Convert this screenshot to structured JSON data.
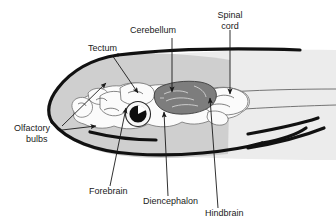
{
  "figure": {
    "background_color": "#ffffff",
    "head_fill_color": "#cfcfcf",
    "body_fill_color": "#e8e8e8",
    "cerebellum_fill_color": "#7d7d7d",
    "brain_fill_color": "#fbfbfb",
    "outline_color": "#111111",
    "label_color": "#1a1a1a"
  },
  "labels": {
    "tectum": {
      "text": "Tectum",
      "x": 88,
      "y": 51
    },
    "cerebellum": {
      "text": "Cerebellum",
      "x": 130,
      "y": 33
    },
    "spinal_cord": {
      "line1": "Spinal",
      "line2": "cord",
      "x": 224,
      "y": 18
    },
    "olfactory_bulbs": {
      "line1": "Olfactory",
      "line2": "bulbs",
      "x": 14,
      "y": 131
    },
    "forebrain": {
      "text": "Forebrain",
      "x": 89,
      "y": 194
    },
    "diencephalon": {
      "text": "Diencephalon",
      "x": 143,
      "y": 204
    },
    "hindbrain": {
      "text": "Hindbrain",
      "x": 205,
      "y": 215
    }
  },
  "regions": [
    {
      "name": "Tectum",
      "description": "optic tectum, dorsal midbrain roof"
    },
    {
      "name": "Cerebellum",
      "description": "dark shaded lobe posterior to tectum"
    },
    {
      "name": "Spinal cord",
      "description": "continues posteriorly from hindbrain"
    },
    {
      "name": "Olfactory bulbs",
      "description": "paired anterior-most structures"
    },
    {
      "name": "Forebrain",
      "description": "telencephalon, anterior to diencephalon"
    },
    {
      "name": "Diencephalon",
      "description": "ventral region below tectum"
    },
    {
      "name": "Hindbrain",
      "description": "medulla region posterior to cerebellum"
    }
  ],
  "icons": {
    "eye": "eye-icon",
    "arrow": "arrow-pointer-icon"
  }
}
